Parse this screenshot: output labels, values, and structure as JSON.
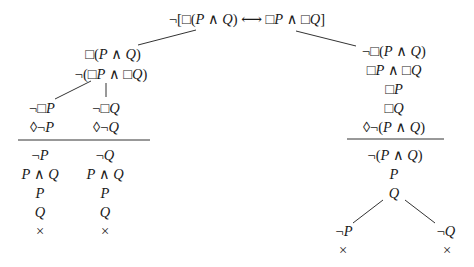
{
  "diagram": {
    "type": "semantic-tableau",
    "root": "¬[□(P ∧ Q) ⟷ □P ∧ □Q]",
    "left_branch": {
      "formulas": [
        "□(P ∧ Q)",
        "¬(□P ∧ □Q)"
      ],
      "left_sub": {
        "above_rule": [
          "¬□P",
          "◊¬P"
        ],
        "below_rule": [
          "¬P",
          "P ∧ Q",
          "P",
          "Q"
        ],
        "closed_mark": "×"
      },
      "right_sub": {
        "above_rule": [
          "¬□Q",
          "◊¬Q"
        ],
        "below_rule": [
          "¬Q",
          "P ∧ Q",
          "P",
          "Q"
        ],
        "closed_mark": "×"
      }
    },
    "right_branch": {
      "above_rule": [
        "¬□(P ∧ Q)",
        "□P ∧ □Q",
        "□P",
        "□Q",
        "◊¬(P ∧ Q)"
      ],
      "below_rule": [
        "¬(P ∧ Q)",
        "P",
        "Q"
      ],
      "left_sub": {
        "formula": "¬P",
        "closed_mark": "×"
      },
      "right_sub": {
        "formula": "¬Q",
        "closed_mark": "×"
      }
    }
  }
}
